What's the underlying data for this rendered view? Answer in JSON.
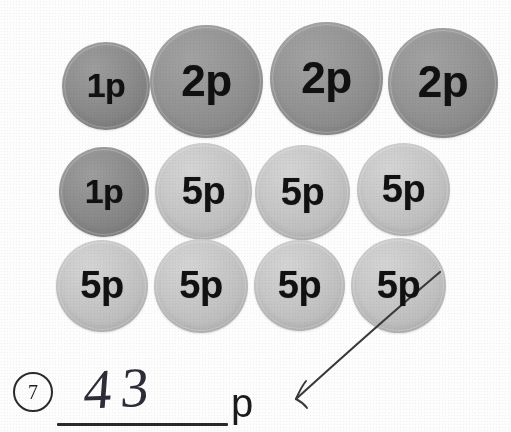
{
  "worksheet": {
    "question_number": "7",
    "unit_label": "p",
    "handwritten_answer": "43",
    "palette": {
      "coin_1p": "#8b8b8b",
      "coin_2p": "#949494",
      "coin_5p": "#c6c6c6",
      "ink": "#2d2d38",
      "page": "#fdfdfd"
    }
  },
  "coins": {
    "rows": [
      {
        "row_label": "row-1",
        "items": [
          {
            "denomination": "1p",
            "tone": "tone-dark",
            "x": 62,
            "y": 42,
            "size": 88,
            "font_size": 34
          },
          {
            "denomination": "2p",
            "tone": "tone-mid",
            "x": 150,
            "y": 25,
            "size": 113,
            "font_size": 44
          },
          {
            "denomination": "2p",
            "tone": "tone-mid",
            "x": 270,
            "y": 22,
            "size": 113,
            "font_size": 44
          },
          {
            "denomination": "2p",
            "tone": "tone-mid",
            "x": 388,
            "y": 28,
            "size": 110,
            "font_size": 44
          }
        ]
      },
      {
        "row_label": "row-2",
        "items": [
          {
            "denomination": "1p",
            "tone": "tone-dark",
            "x": 59,
            "y": 147,
            "size": 90,
            "font_size": 34
          },
          {
            "denomination": "5p",
            "tone": "tone-light",
            "x": 155,
            "y": 143,
            "size": 97,
            "font_size": 38
          },
          {
            "denomination": "5p",
            "tone": "tone-light",
            "x": 255,
            "y": 145,
            "size": 95,
            "font_size": 38
          },
          {
            "denomination": "5p",
            "tone": "tone-light",
            "x": 357,
            "y": 143,
            "size": 93,
            "font_size": 38
          }
        ]
      },
      {
        "row_label": "row-3",
        "items": [
          {
            "denomination": "5p",
            "tone": "tone-light",
            "x": 56,
            "y": 240,
            "size": 92,
            "font_size": 38
          },
          {
            "denomination": "5p",
            "tone": "tone-light",
            "x": 154,
            "y": 239,
            "size": 94,
            "font_size": 38
          },
          {
            "denomination": "5p",
            "tone": "tone-light",
            "x": 254,
            "y": 240,
            "size": 91,
            "font_size": 38
          },
          {
            "denomination": "5p",
            "tone": "tone-light",
            "x": 351,
            "y": 238,
            "size": 95,
            "font_size": 38
          }
        ]
      }
    ],
    "tally": {
      "count_1p": 2,
      "count_2p": 3,
      "count_5p": 7,
      "total_pence": 43
    }
  },
  "annotation": {
    "pointer_description": "hand-drawn arrow from the last 5p coin down-left to the answer unit",
    "arrow_from_x": 440,
    "arrow_from_y": 272,
    "arrow_to_x": 292,
    "arrow_to_y": 404
  }
}
